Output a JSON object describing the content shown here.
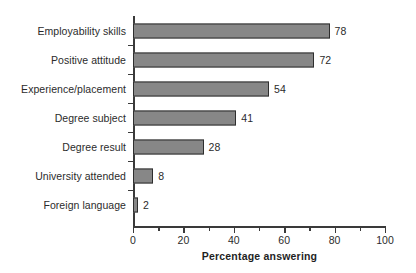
{
  "chart_data": {
    "type": "bar",
    "orientation": "horizontal",
    "title": "",
    "xlabel": "Percentage answering",
    "ylabel": "",
    "xlim": [
      0,
      100
    ],
    "xticks": [
      0,
      20,
      40,
      60,
      80,
      100
    ],
    "xtick_labels": [
      "0",
      "20",
      "40",
      "60",
      "80",
      "100"
    ],
    "minor_xticks": [
      10,
      30,
      50,
      70,
      90
    ],
    "grid": false,
    "legend": null,
    "categories": [
      "Employability skills",
      "Positive attitude",
      "Experience/placement",
      "Degree subject",
      "Degree result",
      "University attended",
      "Foreign language"
    ],
    "values": [
      78,
      72,
      54,
      41,
      28,
      8,
      2
    ],
    "value_labels": [
      "78",
      "72",
      "54",
      "41",
      "28",
      "8",
      "2"
    ],
    "bar_fill_color": "#878787",
    "bar_edge_color": "#2e2e2e",
    "axis_color": "#3a3a3a",
    "background_color": "#ffffff"
  }
}
